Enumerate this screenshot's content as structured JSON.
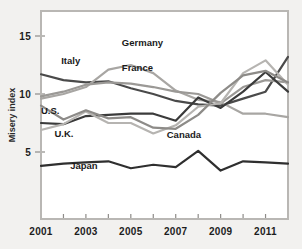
{
  "chart_data": {
    "type": "line",
    "title": "",
    "subtitle": "",
    "xlabel": "",
    "ylabel": "Misery index",
    "xlim": [
      2001,
      2012
    ],
    "ylim": [
      0,
      16.5
    ],
    "yticks": [
      5,
      10,
      15
    ],
    "ytick_labels": [
      "5",
      "10",
      "15"
    ],
    "xticks": [
      2001,
      2002,
      2003,
      2004,
      2005,
      2006,
      2007,
      2008,
      2009,
      2010,
      2011,
      2012
    ],
    "xtick_labels": [
      "2001",
      "",
      "2003",
      "",
      "2005",
      "",
      "2007",
      "",
      "2009",
      "",
      "2011",
      ""
    ],
    "grid": false,
    "legend": "inline-labels",
    "x": [
      2001,
      2002,
      2003,
      2004,
      2005,
      2006,
      2007,
      2008,
      2009,
      2010,
      2011,
      2012
    ],
    "series": [
      {
        "name": "Italy",
        "color": "#4a4a4a",
        "width": 2.2,
        "label": "Italy",
        "label_x": 2001.9,
        "label_y": 12.6,
        "values": [
          11.7,
          11.2,
          11.0,
          11.1,
          10.5,
          10.0,
          9.4,
          9.1,
          9.0,
          9.6,
          10.2,
          13.2
        ]
      },
      {
        "name": "Germany",
        "color": "#a8a6a3",
        "width": 2.2,
        "label": "Germany",
        "label_x": 2004.6,
        "label_y": 14.1,
        "values": [
          9.6,
          10.0,
          10.6,
          12.1,
          12.5,
          11.8,
          10.3,
          9.5,
          9.3,
          8.3,
          8.3,
          8.0
        ]
      },
      {
        "name": "France",
        "color": "#9b9996",
        "width": 2.2,
        "label": "France",
        "label_x": 2004.6,
        "label_y": 12.0,
        "values": [
          9.8,
          10.2,
          10.8,
          11.0,
          10.9,
          10.6,
          10.2,
          10.0,
          9.2,
          10.6,
          11.2,
          11.0
        ]
      },
      {
        "name": "U.S.",
        "color": "#3b3b3b",
        "width": 2.2,
        "label": "U.S.",
        "label_x": 2001.0,
        "label_y": 8.3,
        "values": [
          7.5,
          7.4,
          8.1,
          8.2,
          8.3,
          8.3,
          7.7,
          9.7,
          8.8,
          10.2,
          11.9,
          10.2
        ]
      },
      {
        "name": "U.K.",
        "color": "#b6b4b1",
        "width": 2.2,
        "label": "U.K.",
        "label_x": 2001.6,
        "label_y": 6.3,
        "values": [
          6.9,
          7.4,
          8.5,
          7.5,
          7.5,
          6.6,
          7.3,
          8.9,
          9.2,
          11.8,
          12.9,
          10.8
        ]
      },
      {
        "name": "Canada",
        "color": "#8d8b88",
        "width": 2.2,
        "label": "Canada",
        "label_x": 2006.6,
        "label_y": 6.2,
        "values": [
          9.0,
          7.8,
          8.6,
          7.9,
          8.0,
          7.1,
          7.0,
          8.2,
          10.1,
          11.6,
          12.0,
          11.0
        ]
      },
      {
        "name": "Japan",
        "color": "#2f2f2f",
        "width": 2.2,
        "label": "Japan",
        "label_x": 2002.3,
        "label_y": 3.5,
        "values": [
          3.8,
          4.0,
          4.1,
          4.2,
          3.6,
          3.9,
          3.7,
          5.1,
          3.4,
          4.2,
          4.1,
          4.0
        ]
      }
    ]
  },
  "caption": {
    "text": ""
  }
}
